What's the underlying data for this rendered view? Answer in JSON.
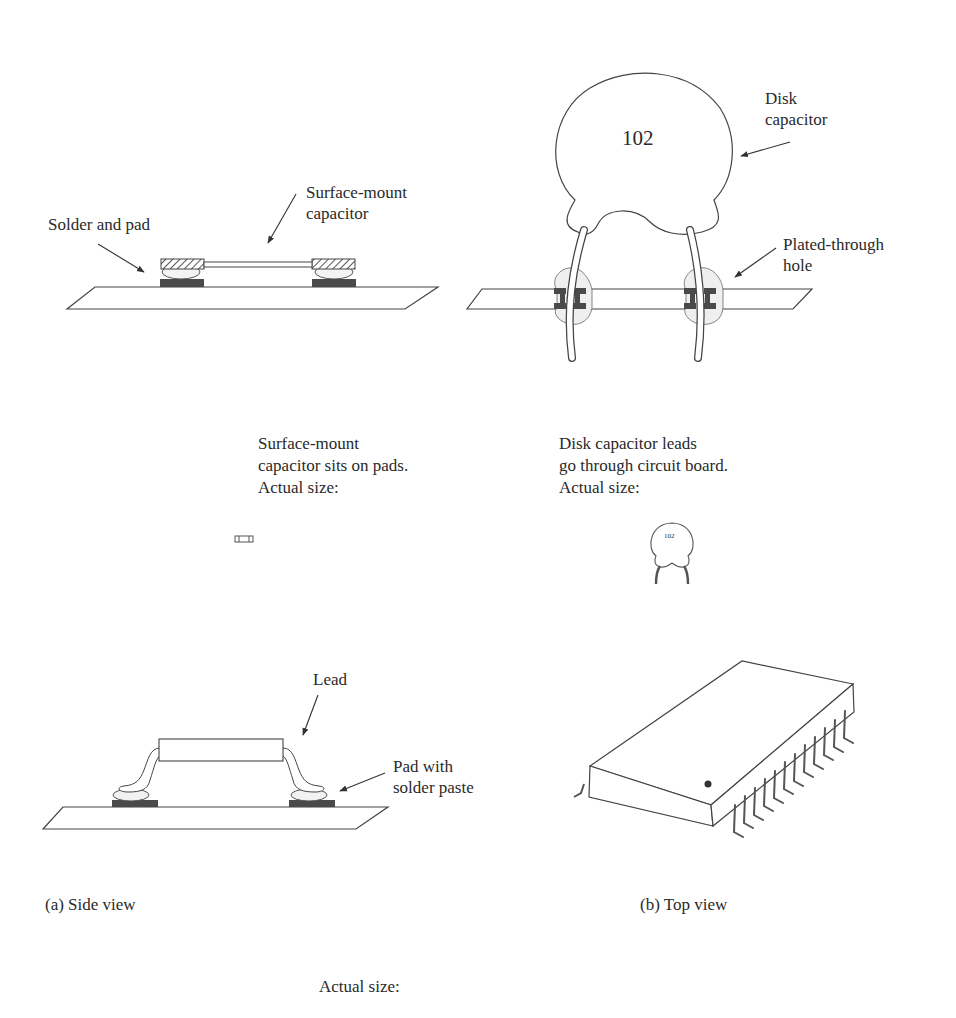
{
  "panel_top_left": {
    "label_component": "Surface-mount\ncapacitor",
    "label_pad": "Solder and pad",
    "caption": "Surface-mount\ncapacitor sits on pads.\nActual size:"
  },
  "panel_top_right": {
    "disk_marking": "102",
    "label_component": "Disk\ncapacitor",
    "label_hole": "Plated-through\nhole",
    "caption": "Disk capacitor leads\ngo through circuit board.\nActual size:",
    "small_marking": "102"
  },
  "panel_bottom_left": {
    "label_lead": "Lead",
    "label_pad": "Pad with\nsolder paste",
    "caption": "(a) Side view"
  },
  "panel_bottom_right": {
    "caption": "(b) Top view"
  },
  "footer": {
    "caption": "Actual size:"
  },
  "colors": {
    "line": "#3a3a3a",
    "pad_fill": "#555555",
    "solder_fill": "#f2f2f2"
  }
}
